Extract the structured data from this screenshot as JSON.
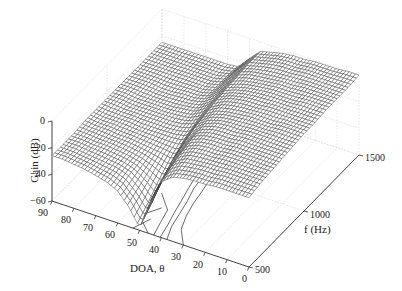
{
  "chart_data": {
    "type": "surface",
    "title": "",
    "xlabel": "DOA, θ",
    "ylabel": "f (Hz)",
    "zlabel": "Gain (dB)",
    "x_ticks": [
      90,
      80,
      70,
      60,
      50,
      40,
      30,
      20,
      10,
      0
    ],
    "y_ticks": [
      500,
      1000,
      1500
    ],
    "z_ticks": [
      0,
      -20,
      -40,
      -60
    ],
    "xlim": [
      0,
      90
    ],
    "ylim": [
      500,
      1500
    ],
    "zlim": [
      -60,
      0
    ],
    "grid": true,
    "theta": [
      0,
      5,
      10,
      15,
      20,
      25,
      30,
      35,
      40,
      45,
      50,
      55,
      60,
      65,
      70,
      75,
      80,
      85,
      90
    ],
    "freq": [
      500,
      600,
      700,
      800,
      900,
      1000,
      1100,
      1200,
      1300,
      1400,
      1500
    ],
    "gain": [
      [
        -8,
        -6,
        -5,
        -4,
        -3,
        -2,
        -2,
        -1,
        -1,
        -1,
        0
      ],
      [
        -8,
        -6,
        -5,
        -4,
        -3,
        -2,
        -2,
        -1,
        -1,
        -1,
        0
      ],
      [
        -8,
        -6,
        -5,
        -4,
        -3,
        -2,
        -2,
        -1,
        -1,
        -1,
        -1
      ],
      [
        -8,
        -6,
        -5,
        -4,
        -3,
        -3,
        -2,
        -2,
        -1,
        -1,
        -1
      ],
      [
        -9,
        -7,
        -5,
        -4,
        -3,
        -3,
        -2,
        -2,
        -2,
        -1,
        -1
      ],
      [
        -9,
        -7,
        -6,
        -5,
        -4,
        -3,
        -3,
        -2,
        -2,
        -2,
        -2
      ],
      [
        -10,
        -8,
        -6,
        -5,
        -4,
        -4,
        -3,
        -3,
        -3,
        -2,
        -2
      ],
      [
        -12,
        -9,
        -7,
        -6,
        -5,
        -5,
        -4,
        -4,
        -4,
        -3,
        -3
      ],
      [
        -18,
        -14,
        -11,
        -9,
        -8,
        -7,
        -6,
        -6,
        -5,
        -5,
        -5
      ],
      [
        -35,
        -28,
        -22,
        -18,
        -14,
        -12,
        -10,
        -9,
        -8,
        -7,
        -7
      ],
      [
        -58,
        -50,
        -40,
        -32,
        -26,
        -22,
        -19,
        -17,
        -16,
        -15,
        -15
      ],
      [
        -45,
        -40,
        -35,
        -30,
        -27,
        -25,
        -24,
        -23,
        -23,
        -23,
        -24
      ],
      [
        -36,
        -33,
        -31,
        -29,
        -27,
        -26,
        -25,
        -25,
        -25,
        -25,
        -25
      ],
      [
        -32,
        -30,
        -29,
        -28,
        -27,
        -26,
        -26,
        -25,
        -25,
        -25,
        -25
      ],
      [
        -30,
        -29,
        -28,
        -27,
        -27,
        -26,
        -26,
        -26,
        -25,
        -25,
        -25
      ],
      [
        -28,
        -28,
        -27,
        -27,
        -26,
        -26,
        -26,
        -26,
        -25,
        -25,
        -25
      ],
      [
        -27,
        -27,
        -27,
        -26,
        -26,
        -26,
        -26,
        -25,
        -25,
        -25,
        -25
      ],
      [
        -26,
        -26,
        -26,
        -26,
        -26,
        -25,
        -25,
        -25,
        -25,
        -25,
        -25
      ],
      [
        -26,
        -26,
        -26,
        -25,
        -25,
        -25,
        -25,
        -25,
        -25,
        -25,
        -25
      ]
    ]
  },
  "labels": {
    "z_title": "Gain (dB)",
    "x_title": "DOA, θ",
    "y_title": "f (Hz)",
    "z_ticks": [
      "0",
      "−20",
      "−40",
      "−60"
    ],
    "x_ticks": [
      "90",
      "80",
      "70",
      "60",
      "50",
      "40",
      "30",
      "20",
      "10",
      "0"
    ],
    "y_ticks": [
      "500",
      "1000",
      "1500"
    ]
  }
}
